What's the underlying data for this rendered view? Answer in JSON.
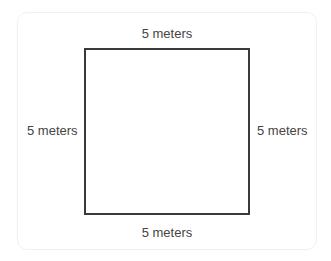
{
  "diagram": {
    "shape": "square",
    "labels": {
      "top": "5 meters",
      "bottom": "5 meters",
      "left": "5 meters",
      "right": "5 meters"
    },
    "colors": {
      "outline": "#3a3a3a",
      "text": "#444444",
      "card_border": "#f1f1f1"
    }
  }
}
